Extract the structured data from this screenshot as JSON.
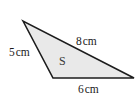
{
  "figure": {
    "type": "triangle-diagram",
    "background_color": "#ffffff",
    "shape": {
      "name": "triangle",
      "fill_color": "#e9e9e9",
      "stroke_color": "#1c1c1c",
      "stroke_width": 1.6,
      "vertices": [
        {
          "name": "apex-top-left",
          "x": 23,
          "y": 21
        },
        {
          "name": "vertex-bottom-left",
          "x": 53,
          "y": 78
        },
        {
          "name": "vertex-bottom-right",
          "x": 134,
          "y": 78
        }
      ]
    },
    "region_label": {
      "text": "S",
      "color": "#3a3a3a"
    },
    "side_labels": [
      {
        "id": "side-a",
        "value": "5",
        "unit": "cm",
        "text": "5 cm",
        "side": "left"
      },
      {
        "id": "side-b",
        "value": "8",
        "unit": "cm",
        "text": "8 cm",
        "side": "upper-right"
      },
      {
        "id": "side-c",
        "value": "6",
        "unit": "cm",
        "text": "6 cm",
        "side": "bottom"
      }
    ]
  }
}
